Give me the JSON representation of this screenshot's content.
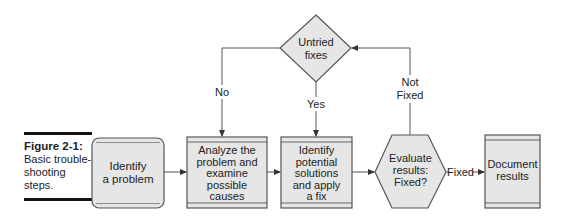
{
  "figure": {
    "label": "Figure 2-1:",
    "caption": "Basic trouble-shooting steps."
  },
  "nodes": {
    "identify_problem": {
      "lines": [
        "Identify",
        "a problem"
      ]
    },
    "analyze": {
      "lines": [
        "Analyze the",
        "problem and",
        "examine",
        "possible",
        "causes"
      ]
    },
    "apply_fix": {
      "lines": [
        "Identify",
        "potential",
        "solutions",
        "and apply",
        "a fix"
      ]
    },
    "evaluate": {
      "lines": [
        "Evaluate",
        "results:",
        "Fixed?"
      ]
    },
    "document": {
      "lines": [
        "Document",
        "results"
      ]
    },
    "untried": {
      "lines": [
        "Untried",
        "fixes"
      ]
    }
  },
  "edges": {
    "no": "No",
    "yes": "Yes",
    "not_fixed_1": "Not",
    "not_fixed_2": "Fixed",
    "fixed": "Fixed"
  },
  "colors": {
    "fill": "#e6e6e6",
    "stroke": "#555555",
    "text": "#222222"
  }
}
